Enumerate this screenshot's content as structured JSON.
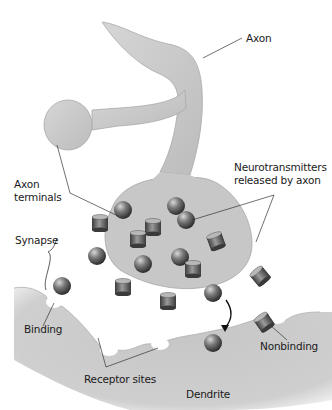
{
  "diagram": {
    "labels": {
      "axon": "Axon",
      "axon_terminals": "Axon\nterminals",
      "neurotransmitters": "Neurotransmitters\nreleased by axon",
      "synapse": "Synapse",
      "binding": "Binding",
      "nonbinding": "Nonbinding",
      "receptor_sites": "Receptor sites",
      "dendrite": "Dendrite"
    },
    "colors": {
      "tissue": "#c8c8c8",
      "tissue_edge": "#9a9a9a",
      "molecule_dark": "#4a4a4a",
      "molecule_light": "#bdbdbd",
      "leader_line": "#333333",
      "background": "#ffffff"
    }
  }
}
